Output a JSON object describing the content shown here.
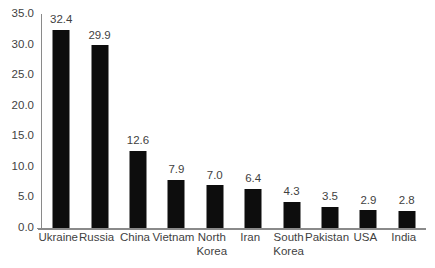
{
  "chart_data": {
    "type": "bar",
    "title": "",
    "subtitle": "",
    "xlabel": "",
    "ylabel": "",
    "categories": [
      "Ukraine",
      "Russia",
      "China",
      "Vietnam",
      "North Korea",
      "Iran",
      "South Korea",
      "Pakistan",
      "USA",
      "India"
    ],
    "values": [
      32.4,
      29.9,
      12.6,
      7.9,
      7.0,
      6.4,
      4.3,
      3.5,
      2.9,
      2.8
    ],
    "value_labels": [
      "32.4",
      "29.9",
      "12.6",
      "7.9",
      "7.0",
      "6.4",
      "4.3",
      "3.5",
      "2.9",
      "2.8"
    ],
    "category_label_lines": [
      [
        "Ukraine"
      ],
      [
        "Russia"
      ],
      [
        "China"
      ],
      [
        "Vietnam"
      ],
      [
        "North",
        "Korea"
      ],
      [
        "Iran"
      ],
      [
        "South",
        "Korea"
      ],
      [
        "Pakistan"
      ],
      [
        "USA"
      ],
      [
        "India"
      ]
    ],
    "ylim": [
      0.0,
      35.0
    ],
    "y_ticks": [
      0.0,
      5.0,
      10.0,
      15.0,
      20.0,
      25.0,
      30.0,
      35.0
    ],
    "y_tick_labels": [
      "0.0",
      "5.0",
      "10.0",
      "15.0",
      "20.0",
      "25.0",
      "30.0",
      "35.0"
    ],
    "grid": false,
    "legend": false,
    "legend_position": "none",
    "data_labels": true,
    "bar_color": "#0d0d0d",
    "axis_color": "#8a8a8a",
    "text_color": "#3f3f3f",
    "background_color": "#ffffff"
  }
}
